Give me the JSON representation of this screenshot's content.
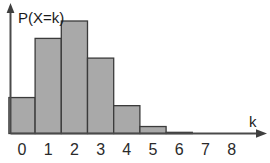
{
  "chart_data": {
    "type": "bar",
    "title": "",
    "subtitle": "",
    "xlabel": "k",
    "ylabel": "P(X=k)",
    "categories": [
      "0",
      "1",
      "2",
      "3",
      "4",
      "5",
      "6",
      "7",
      "8"
    ],
    "values": [
      0.31,
      0.82,
      0.97,
      0.65,
      0.24,
      0.06,
      0.01,
      0.0,
      0.0
    ],
    "xtick_labels": [
      "0",
      "1",
      "2",
      "3",
      "4",
      "5",
      "6",
      "7",
      "8"
    ],
    "xlim": [
      -0.5,
      8.6
    ],
    "ylim": [
      0,
      1.05
    ],
    "ytick_labels": [],
    "grid": false,
    "legend": [],
    "legend_position": "none",
    "annotations": [],
    "axis_arrows": {
      "x_axis_arrow": true,
      "y_axis_arrow": true
    }
  },
  "figure": {
    "y_axis_label": "P(X=k)",
    "x_axis_label": "k",
    "bar_fill_color": "#a9a9a9",
    "bar_stroke_color": "#3b3b3b",
    "axis_color": "#4a4a4a",
    "text_color": "#2a2a2a",
    "background_color": "#ffffff"
  }
}
